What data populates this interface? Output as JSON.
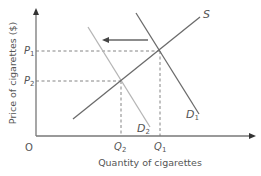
{
  "diagram": {
    "type": "supply-demand",
    "y_axis_label": "Price of cigarettes ($)",
    "x_axis_label": "Quantity of cigarettes",
    "origin_label": "O",
    "price_labels": [
      {
        "main": "P",
        "sub": "1"
      },
      {
        "main": "P",
        "sub": "2"
      }
    ],
    "quantity_labels": [
      {
        "main": "Q",
        "sub": "2"
      },
      {
        "main": "Q",
        "sub": "1"
      }
    ],
    "curves": {
      "supply": {
        "label": "S",
        "color": "#6b6b6b"
      },
      "demand_original": {
        "main": "D",
        "sub": "1",
        "color": "#6b6b6b"
      },
      "demand_shifted": {
        "main": "D",
        "sub": "2",
        "color": "#b5b5b5"
      }
    },
    "shift_arrow": {
      "direction": "left",
      "color": "#666666"
    },
    "colors": {
      "axis": "#777777",
      "dashed": "#777777",
      "text": "#555555"
    }
  }
}
